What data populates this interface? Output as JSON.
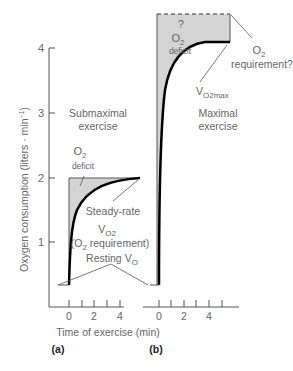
{
  "figure": {
    "y_axis_label": "Oxygen consumption (liters · min",
    "y_axis_label_sup": "−1",
    "y_axis_label_close": ")",
    "y_ticks": [
      "1",
      "2",
      "3",
      "4"
    ],
    "x_axis_label": "Time of exercise (min)",
    "x_ticks_a": [
      "0",
      "2",
      "4"
    ],
    "x_ticks_b": [
      "0",
      "2",
      "4"
    ],
    "panel_a": {
      "tag": "(a)",
      "title_line1": "Submaximal",
      "title_line2": "exercise",
      "deficit_o": "O",
      "deficit_sub": "2",
      "deficit_label": "deficit",
      "steady_line1": "Steady-rate",
      "steady_v": "V",
      "steady_sub": "O2",
      "steady_line3": "(O",
      "steady_line3_sub": "2",
      "steady_line3_end": " requirement)",
      "resting_label": "Resting ",
      "resting_v": "V",
      "resting_sub": "O"
    },
    "panel_b": {
      "tag": "(b)",
      "question": "?",
      "deficit_o": "O",
      "deficit_sub": "2",
      "deficit_label": "deficit",
      "req_o": "O",
      "req_sub": "2",
      "req_label": "requirement?",
      "vmax_v": "V",
      "vmax_sub": "O2max",
      "title_line1": "Maximal",
      "title_line2": "exercise"
    }
  },
  "colors": {
    "shade": "#d4d4d4",
    "curve": "#000000",
    "axis": "#555555"
  }
}
